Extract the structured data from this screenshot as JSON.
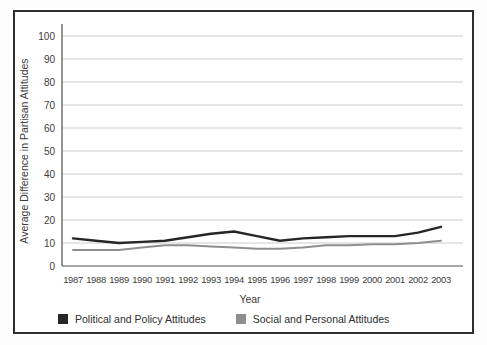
{
  "chart_data": {
    "type": "line",
    "title": "",
    "x": [
      1987,
      1988,
      1989,
      1990,
      1991,
      1992,
      1993,
      1994,
      1995,
      1996,
      1997,
      1998,
      1999,
      2000,
      2001,
      2002,
      2003
    ],
    "xlabel": "Year",
    "ylabel": "Average Difference in Partisan Attitudes",
    "ylim": [
      0,
      100
    ],
    "ytick_interval": 10,
    "grid": "horizontal-only",
    "legend_position": "bottom-left",
    "series": [
      {
        "name": "Political and Policy Attitudes",
        "color": "#262626",
        "values": [
          12,
          11,
          10,
          10.5,
          11,
          12.5,
          14,
          15,
          13,
          11,
          12,
          12.5,
          13,
          13,
          13,
          14.5,
          17
        ]
      },
      {
        "name": "Social and Personal Attitudes",
        "color": "#8e8e8e",
        "values": [
          7,
          7,
          7,
          8,
          9,
          9,
          8.5,
          8,
          7.5,
          7.5,
          8,
          9,
          9,
          9.5,
          9.5,
          10,
          11
        ]
      }
    ]
  },
  "figure": {
    "border_color": "#2f2f2f",
    "background": "#ffffff",
    "gridline_color": "#cccccc",
    "axis_color": "#4d4d4d",
    "text_color": "#3c3c3c"
  }
}
